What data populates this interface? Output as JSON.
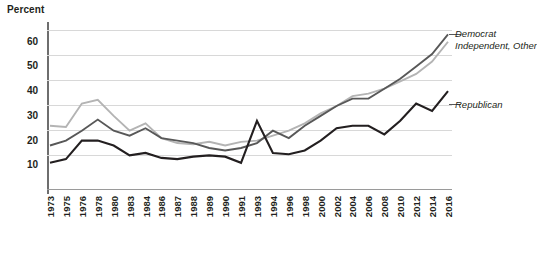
{
  "chart_data": {
    "type": "line",
    "title": "",
    "ylabel": "Percent",
    "xlabel": "",
    "ylim": [
      0,
      68
    ],
    "yticks": [
      10,
      20,
      30,
      40,
      50,
      60
    ],
    "grid": true,
    "legend_position": "inline-right",
    "categories": [
      1973,
      1975,
      1976,
      1978,
      1980,
      1983,
      1984,
      1986,
      1987,
      1988,
      1989,
      1990,
      1991,
      1993,
      1994,
      1996,
      1998,
      2000,
      2002,
      2004,
      2006,
      2008,
      2010,
      2012,
      2014,
      2016
    ],
    "series": [
      {
        "name": "Democrat",
        "color": "#585858",
        "values": [
          18,
          20,
          24,
          28.5,
          24,
          22,
          25,
          21,
          20,
          19,
          17,
          16,
          17,
          19,
          24,
          21,
          26,
          30,
          34,
          37,
          37,
          41,
          45,
          50,
          55,
          63
        ]
      },
      {
        "name": "Independent, Other",
        "color": "#b4b4b4",
        "values": [
          26,
          25.5,
          35,
          36.5,
          30,
          24,
          27,
          21,
          19,
          18.5,
          19.5,
          18,
          19.5,
          20,
          22,
          24,
          27,
          31,
          34,
          38,
          39,
          41,
          44,
          47,
          52,
          60
        ]
      },
      {
        "name": "Republican",
        "color": "#231f20",
        "values": [
          11,
          12.5,
          20,
          20,
          18,
          14,
          15,
          13,
          12.5,
          13.5,
          14,
          13.5,
          11,
          28,
          15,
          14.5,
          16,
          20,
          25,
          26,
          26,
          22.5,
          28,
          35,
          32,
          40
        ]
      }
    ]
  },
  "axis": {
    "y_tick_labels": [
      "60",
      "50",
      "40",
      "30",
      "20",
      "10"
    ],
    "x_tick_labels": [
      "1973",
      "1975",
      "1976",
      "1978",
      "1980",
      "1983",
      "1984",
      "1986",
      "1987",
      "1988",
      "1989",
      "1990",
      "1991",
      "1993",
      "1994",
      "1996",
      "1998",
      "2000",
      "2002",
      "2004",
      "2006",
      "2008",
      "2010",
      "2012",
      "2014",
      "2016"
    ]
  },
  "series_labels": {
    "democrat": "Democrat",
    "independent": "Independent, Other",
    "republican": "Republican"
  }
}
